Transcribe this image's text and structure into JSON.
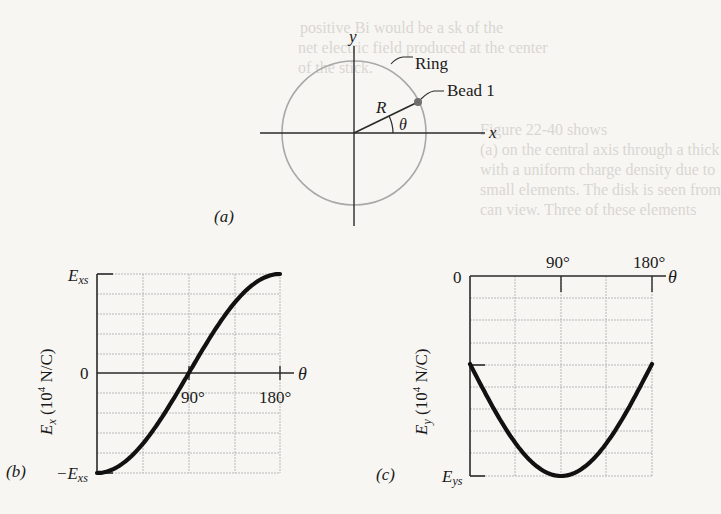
{
  "figure": {
    "panel_a": {
      "label": "(a)",
      "x_axis_label": "x",
      "y_axis_label": "y",
      "ring_label": "Ring",
      "bead_label": "Bead 1",
      "radius_label": "R",
      "angle_label": "θ",
      "colors": {
        "ring": "#a8a8a8",
        "bead": "#6e6e6e",
        "axes": "#2a2a2a"
      }
    },
    "panel_b": {
      "label": "(b)",
      "y_axis_title": "E_x (10^4 N/C)",
      "y_axis_title_main": "E",
      "y_axis_title_sub": "x",
      "y_axis_title_rest": " (10",
      "y_axis_title_sup": "4",
      "y_axis_title_end": " N/C)",
      "y_tick_top": "E",
      "y_tick_top_sub": "xs",
      "y_tick_zero": "0",
      "y_tick_bottom": "−E",
      "y_tick_bottom_sub": "xs",
      "x_axis_label": "θ",
      "x_tick_90": "90°",
      "x_tick_180": "180°"
    },
    "panel_c": {
      "label": "(c)",
      "y_axis_title": "E_y (10^4 N/C)",
      "y_axis_title_main": "E",
      "y_axis_title_sub": "y",
      "y_axis_title_rest": " (10",
      "y_axis_title_sup": "4",
      "y_axis_title_end": " N/C)",
      "y_tick_top": "0",
      "y_tick_bottom": "E",
      "y_tick_bottom_sub": "ys",
      "x_axis_label": "θ",
      "x_tick_90": "90°",
      "x_tick_180": "180°"
    }
  },
  "chart_data": [
    {
      "type": "line",
      "title": "(b) E_x vs θ",
      "xlabel": "θ",
      "ylabel": "E_x (10^4 N/C)",
      "x": [
        0,
        30,
        60,
        90,
        120,
        150,
        180
      ],
      "x_ticks": [
        "90°",
        "180°"
      ],
      "y_ticks": [
        "E_xs",
        "0",
        "−E_xs"
      ],
      "series": [
        {
          "name": "E_x (in units of E_xs)",
          "values": [
            -1.0,
            -0.87,
            -0.5,
            0.0,
            0.5,
            0.87,
            1.0
          ]
        }
      ],
      "xlim": [
        0,
        180
      ],
      "ylim": [
        -1,
        1
      ],
      "grid": true,
      "grid_divisions": {
        "x": 4,
        "y": 10
      }
    },
    {
      "type": "line",
      "title": "(c) E_y vs θ",
      "xlabel": "θ",
      "ylabel": "E_y (10^4 N/C)",
      "x": [
        0,
        30,
        60,
        90,
        120,
        150,
        180
      ],
      "x_ticks": [
        "90°",
        "180°"
      ],
      "y_ticks": [
        "0",
        "E_ys"
      ],
      "series": [
        {
          "name": "E_y (in units of E_ys)",
          "values": [
            0.44,
            0.72,
            0.92,
            1.0,
            0.92,
            0.72,
            0.44
          ]
        }
      ],
      "xlim": [
        0,
        180
      ],
      "ylim": [
        0,
        1
      ],
      "y_direction": "downward (0 at top, E_ys at bottom)",
      "grid": true,
      "grid_divisions": {
        "x": 4,
        "y": 9
      }
    }
  ]
}
